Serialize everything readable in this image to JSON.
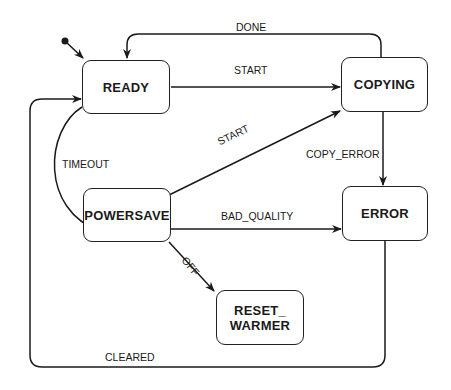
{
  "diagram": {
    "type": "state-machine",
    "states": [
      {
        "id": "ready",
        "label": "READY"
      },
      {
        "id": "copying",
        "label": "COPYING"
      },
      {
        "id": "powersave",
        "label": "POWERSAVE"
      },
      {
        "id": "error",
        "label": "ERROR"
      },
      {
        "id": "reset_warmer",
        "label_line1": "RESET_",
        "label_line2": "WARMER"
      }
    ],
    "transitions": [
      {
        "from": "initial",
        "to": "ready",
        "label": ""
      },
      {
        "from": "ready",
        "to": "copying",
        "label": "START"
      },
      {
        "from": "copying",
        "to": "ready",
        "label": "DONE"
      },
      {
        "from": "ready",
        "to": "powersave",
        "label": "TIMEOUT"
      },
      {
        "from": "powersave",
        "to": "copying",
        "label": "START"
      },
      {
        "from": "copying",
        "to": "error",
        "label": "COPY_ERROR"
      },
      {
        "from": "powersave",
        "to": "error",
        "label": "BAD_QUALITY"
      },
      {
        "from": "powersave",
        "to": "reset_warmer",
        "label": "OFF"
      },
      {
        "from": "error",
        "to": "ready",
        "label": "CLEARED"
      }
    ]
  }
}
